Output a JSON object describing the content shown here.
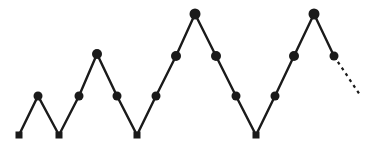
{
  "figure": {
    "title": "",
    "background_color": "#ffffff",
    "line_color": "#1a1a1a",
    "marker_color": "#1a1a1a",
    "line_width": 2.4,
    "width": 369,
    "height": 150
  },
  "chart_data": {
    "type": "line",
    "title": "",
    "xlabel": "",
    "ylabel": "",
    "grid": false,
    "legend": null,
    "axes_visible": false,
    "xlim": [
      0,
      369
    ],
    "ylim": [
      150,
      0
    ],
    "series": [
      {
        "name": "zigzag-series",
        "style": "solid",
        "color": "#1a1a1a",
        "x": [
          19,
          38,
          59,
          79,
          97,
          117,
          137,
          156,
          176,
          195,
          216,
          236,
          256,
          275,
          294,
          314,
          334
        ],
        "y": [
          135,
          96,
          135,
          96,
          54,
          96,
          135,
          96,
          56,
          14,
          56,
          96,
          135,
          96,
          56,
          14,
          56
        ],
        "markers": [
          "square",
          "circle",
          "square",
          "circle",
          "circle",
          "circle",
          "square",
          "circle",
          "circle",
          "circle",
          "circle",
          "circle",
          "square",
          "circle",
          "circle",
          "circle",
          "circle"
        ],
        "marker_sizes": [
          7,
          9,
          7,
          9,
          10,
          9,
          7,
          9,
          10,
          11,
          10,
          9,
          7,
          9,
          10,
          11,
          9
        ]
      },
      {
        "name": "projection-series",
        "style": "dashed",
        "color": "#1a1a1a",
        "dash_pattern": "3,4",
        "x": [
          334,
          360
        ],
        "y": [
          56,
          95
        ],
        "markers": [
          "none",
          "none"
        ],
        "marker_sizes": [
          0,
          0
        ]
      }
    ],
    "annotations": []
  }
}
